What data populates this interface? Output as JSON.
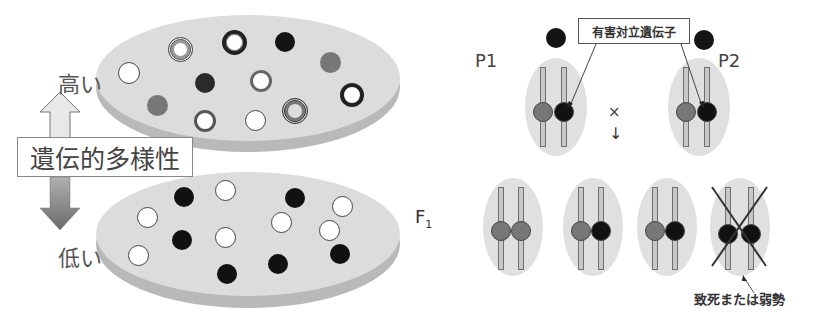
{
  "left_panel": {
    "high_label": "高い",
    "low_label": "低い",
    "axis_label": "遺伝的多様性",
    "f1_label": "F",
    "f1_sub": "1",
    "high_population": {
      "description": "high genetic diversity population",
      "individuals": [
        {
          "type": "white"
        },
        {
          "type": "double-ring"
        },
        {
          "type": "bold-ring"
        },
        {
          "type": "black"
        },
        {
          "type": "gray"
        },
        {
          "type": "dark"
        },
        {
          "type": "gray-ring"
        },
        {
          "type": "gray"
        },
        {
          "type": "gray-ring"
        },
        {
          "type": "white"
        },
        {
          "type": "double-ring"
        },
        {
          "type": "bold-ring"
        }
      ]
    },
    "low_population": {
      "description": "low genetic diversity population",
      "individuals": [
        {
          "type": "white"
        },
        {
          "type": "black"
        },
        {
          "type": "white"
        },
        {
          "type": "black"
        },
        {
          "type": "white"
        },
        {
          "type": "white"
        },
        {
          "type": "black"
        },
        {
          "type": "white"
        },
        {
          "type": "white"
        },
        {
          "type": "black"
        },
        {
          "type": "white"
        },
        {
          "type": "black"
        },
        {
          "type": "black"
        },
        {
          "type": "white"
        }
      ]
    }
  },
  "right_panel": {
    "p1_label": "P1",
    "p2_label": "P2",
    "callout_label": "有害対立遺伝子",
    "cross_symbol": "×",
    "down_arrow": "↓",
    "lethal_label": "致死または弱勢",
    "offspring": [
      {
        "alleles": [
          "normal",
          "normal"
        ],
        "crossed_out": false
      },
      {
        "alleles": [
          "normal",
          "deleterious"
        ],
        "crossed_out": false
      },
      {
        "alleles": [
          "normal",
          "deleterious"
        ],
        "crossed_out": false
      },
      {
        "alleles": [
          "deleterious",
          "deleterious"
        ],
        "crossed_out": true
      }
    ]
  },
  "colors": {
    "disc_top": "#dcdcdc",
    "disc_edge": "#b9b9b9",
    "black_allele": "#111111",
    "gray_allele": "#7a7a7a",
    "up_arrow": "#e6e6e6",
    "down_arrow": "#7a7a7a"
  }
}
